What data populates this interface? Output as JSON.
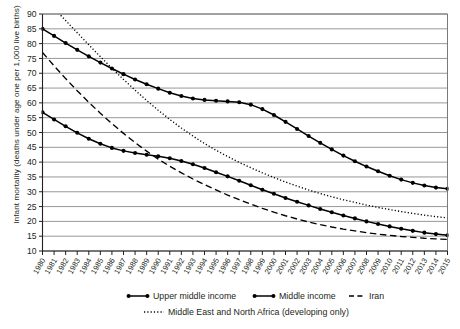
{
  "chart_data": {
    "type": "line",
    "title": "",
    "xlabel": "",
    "ylabel": "Infant mortality (deaths under age one per 1,000 live births)",
    "ylim": [
      10,
      90
    ],
    "ytick_step": 5,
    "yticks": [
      10,
      15,
      20,
      25,
      30,
      35,
      40,
      45,
      50,
      55,
      60,
      65,
      70,
      75,
      80,
      85,
      90
    ],
    "grid": true,
    "legend_position": "bottom",
    "x": [
      1980,
      1981,
      1982,
      1983,
      1984,
      1985,
      1986,
      1987,
      1988,
      1989,
      1990,
      1991,
      1992,
      1993,
      1994,
      1995,
      1996,
      1997,
      1998,
      1999,
      2000,
      2001,
      2002,
      2003,
      2004,
      2005,
      2006,
      2007,
      2008,
      2009,
      2010,
      2011,
      2012,
      2013,
      2014,
      2015
    ],
    "xtick_labels": [
      "1980",
      "1981",
      "1982",
      "1983",
      "1984",
      "1985",
      "1986",
      "1987",
      "1988",
      "1989",
      "1990",
      "1991",
      "1992",
      "1993",
      "1994",
      "1995",
      "1996",
      "1997",
      "1998",
      "1999",
      "2000",
      "2001",
      "2002",
      "2003",
      "2004",
      "2005",
      "2006",
      "2007",
      "2008",
      "2009",
      "2010",
      "2011",
      "2012",
      "2013",
      "2014",
      "2015"
    ],
    "series": [
      {
        "name": "Upper middle income",
        "style": "solid-marker",
        "color": "#000000",
        "values": [
          85.0,
          82.6,
          80.2,
          77.9,
          75.7,
          73.6,
          71.6,
          69.7,
          67.9,
          66.3,
          64.8,
          63.4,
          62.3,
          61.5,
          61.0,
          60.7,
          60.5,
          60.2,
          59.4,
          57.9,
          55.9,
          53.6,
          51.2,
          48.8,
          46.5,
          44.3,
          42.2,
          40.3,
          38.5,
          36.9,
          35.4,
          34.1,
          33.0,
          32.1,
          31.4,
          31.0
        ]
      },
      {
        "name": "Middle income",
        "style": "solid-marker",
        "color": "#000000",
        "values": [
          56.8,
          54.4,
          52.1,
          49.9,
          47.9,
          46.2,
          44.8,
          43.8,
          43.1,
          42.5,
          42.0,
          41.3,
          40.4,
          39.3,
          38.0,
          36.6,
          35.2,
          33.7,
          32.2,
          30.7,
          29.3,
          27.9,
          26.6,
          25.4,
          24.2,
          23.1,
          22.0,
          21.0,
          20.0,
          19.1,
          18.3,
          17.5,
          16.8,
          16.2,
          15.7,
          15.3
        ]
      },
      {
        "name": "Iran",
        "style": "dashed",
        "color": "#000000",
        "values": [
          77.0,
          72.5,
          68.2,
          64.1,
          60.2,
          56.5,
          53.0,
          49.7,
          46.6,
          43.7,
          41.0,
          38.6,
          36.4,
          34.3,
          32.4,
          30.6,
          28.9,
          27.3,
          25.8,
          24.4,
          23.1,
          21.9,
          20.8,
          19.8,
          18.9,
          18.1,
          17.4,
          16.8,
          16.2,
          15.7,
          15.3,
          14.9,
          14.6,
          14.3,
          14.1,
          13.9
        ]
      },
      {
        "name": "Middle East and North Africa (developing only)",
        "style": "dotted",
        "color": "#000000",
        "values": [
          96.0,
          91.9,
          87.8,
          83.7,
          79.6,
          75.6,
          71.7,
          67.9,
          64.3,
          60.8,
          57.5,
          54.4,
          51.5,
          48.8,
          46.3,
          44.0,
          41.9,
          39.9,
          38.1,
          36.4,
          34.8,
          33.3,
          31.9,
          30.6,
          29.4,
          28.3,
          27.3,
          26.4,
          25.5,
          24.7,
          24.0,
          23.3,
          22.7,
          22.1,
          21.6,
          21.2
        ]
      }
    ]
  },
  "legend": {
    "items": [
      {
        "label": "Upper middle income",
        "style": "solid-marker"
      },
      {
        "label": "Middle income",
        "style": "solid-marker"
      },
      {
        "label": "Iran",
        "style": "dashed"
      },
      {
        "label": "Middle East and North Africa (developing only)",
        "style": "dotted"
      }
    ]
  }
}
